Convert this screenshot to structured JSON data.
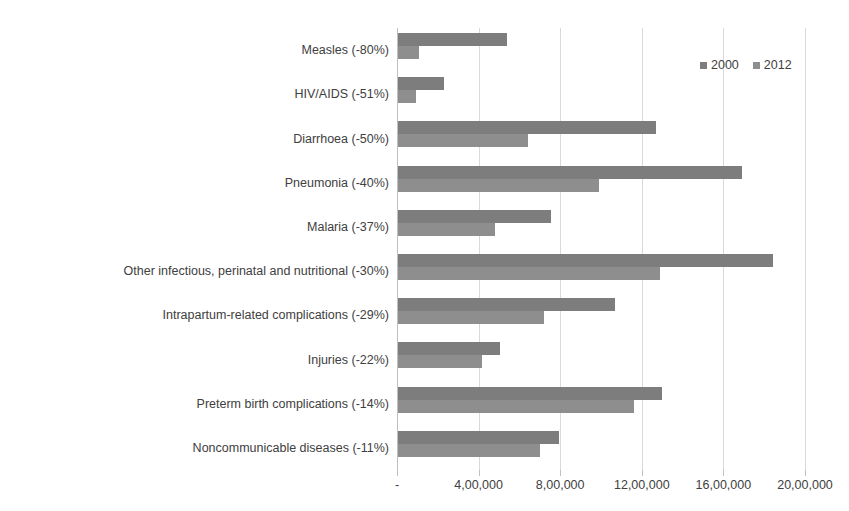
{
  "chart_data": {
    "type": "bar",
    "orientation": "horizontal",
    "title": "",
    "subtitle": "",
    "xlabel": "",
    "ylabel": "",
    "xlim": [
      0,
      2000000
    ],
    "grid": true,
    "legend_position": "top-right",
    "categories": [
      "Measles (-80%)",
      "HIV/AIDS (-51%)",
      "Diarrhoea (-50%)",
      "Pneumonia (-40%)",
      "Malaria (-37%)",
      "Other infectious, perinatal and nutritional (-30%)",
      "Intrapartum-related complications (-29%)",
      "Injuries (-22%)",
      "Preterm birth complications (-14%)",
      "Noncommunicable diseases (-11%)"
    ],
    "series": [
      {
        "name": "2000",
        "color": "#7d7d7d",
        "values": [
          540000,
          230000,
          1270000,
          1690000,
          755000,
          1845000,
          1070000,
          505000,
          1300000,
          795000
        ]
      },
      {
        "name": "2012",
        "color": "#8e8e8e",
        "values": [
          110000,
          93000,
          640000,
          990000,
          480000,
          1290000,
          720000,
          415000,
          1160000,
          700000
        ]
      }
    ],
    "xticks": [
      0,
      400000,
      800000,
      1200000,
      1600000,
      2000000
    ],
    "xticklabels": [
      "-",
      "4,00,000",
      "8,00,000",
      "12,00,000",
      "16,00,000",
      "20,00,000"
    ]
  },
  "legend": {
    "items": [
      {
        "label": "2000",
        "color": "#7d7d7d"
      },
      {
        "label": "2012",
        "color": "#8e8e8e"
      }
    ]
  },
  "colors": {
    "series_2000": "#7d7d7d",
    "series_2012": "#8e8e8e",
    "gridline": "#d9d9d9",
    "axis": "#bfbfbf",
    "text": "#404040",
    "background": "#ffffff"
  }
}
